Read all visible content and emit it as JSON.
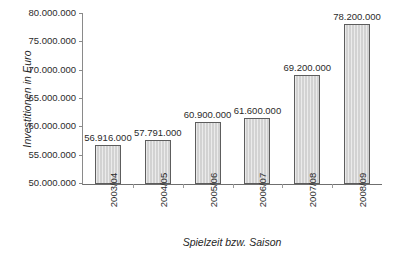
{
  "chart_data": {
    "type": "bar",
    "title": "",
    "xlabel": "Spielzeit bzw. Saison",
    "ylabel": "Investitionen in Euro",
    "categories": [
      "2003/04",
      "2004/05",
      "2005/06",
      "2006/07",
      "2007/08",
      "2008/09"
    ],
    "values": [
      56916000,
      57791000,
      60900000,
      61600000,
      69200000,
      78200000
    ],
    "value_labels": [
      "56.916.000",
      "57.791.000",
      "60.900.000",
      "61.600.000",
      "69.200.000",
      "78.200.000"
    ],
    "ylim": [
      50000000,
      80000000
    ],
    "ytick_values": [
      50000000,
      55000000,
      60000000,
      65000000,
      70000000,
      75000000,
      80000000
    ],
    "ytick_labels": [
      "50.000.000",
      "55.000.000",
      "60.000.000",
      "65.000.000",
      "70.000.000",
      "75.000.000",
      "80.000.000"
    ],
    "grid": false,
    "legend": false,
    "bar_color": "#d2d2d2",
    "bar_border_color": "#5d5d5d",
    "axis_color": "#6f6f6f",
    "background": "#ffffff"
  }
}
